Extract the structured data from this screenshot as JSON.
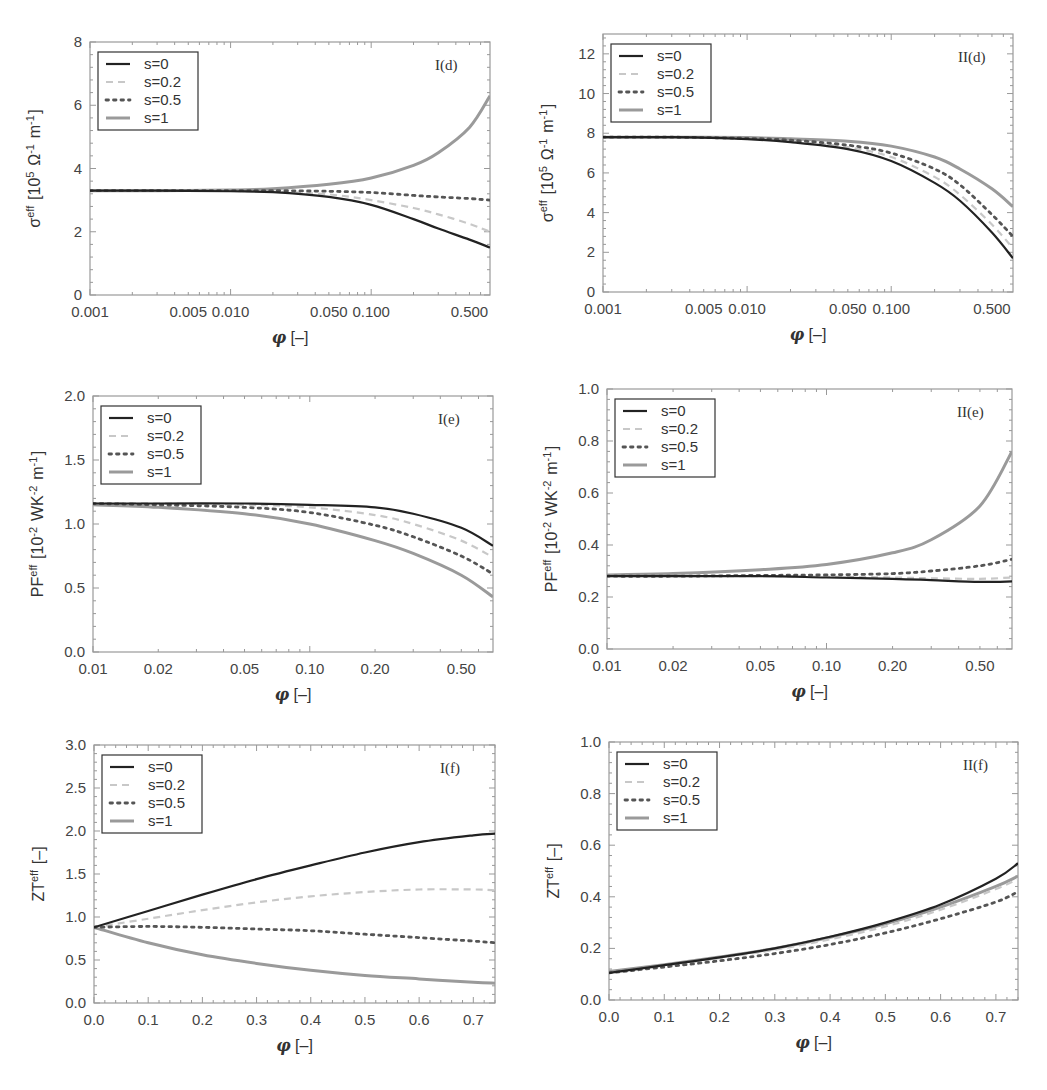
{
  "figure": {
    "legend_entries": [
      "s=0",
      "s=0.2",
      "s=0.5",
      "s=1"
    ],
    "series_styles": [
      {
        "name": "s=0",
        "color": "#222222",
        "dash": "",
        "width": 2.2
      },
      {
        "name": "s=0.2",
        "color": "#c8c8c8",
        "dash": "7,5",
        "width": 2.2
      },
      {
        "name": "s=0.5",
        "color": "#555555",
        "dash": "2.5,5",
        "width": 2.8
      },
      {
        "name": "s=1",
        "color": "#9a9a9a",
        "dash": "",
        "width": 3.0
      }
    ]
  },
  "chart_data": [
    {
      "id": "I(d)",
      "type": "line",
      "tag": "I(d)",
      "xscale": "log",
      "xlim": [
        0.001,
        0.7
      ],
      "ylim": [
        0,
        8
      ],
      "xticks": [
        0.001,
        0.005,
        0.01,
        0.05,
        0.1,
        0.5
      ],
      "xtick_labels": [
        "0.001",
        "0.005",
        "0.010",
        "0.050",
        "0.100",
        "0.500"
      ],
      "yticks": [
        0,
        2,
        4,
        6,
        8
      ],
      "ytick_labels": [
        "0",
        "2",
        "4",
        "6",
        "8"
      ],
      "xlabel": "φ [–]",
      "ylabel": "σ^eff [10^5 Ω^-1 m^-1]",
      "box": [
        90,
        42,
        490,
        295
      ],
      "x": [
        0.001,
        0.003,
        0.01,
        0.02,
        0.05,
        0.1,
        0.2,
        0.3,
        0.5,
        0.7
      ],
      "series": [
        {
          "name": "s=0",
          "values": [
            3.3,
            3.3,
            3.28,
            3.25,
            3.1,
            2.85,
            2.4,
            2.1,
            1.75,
            1.5
          ]
        },
        {
          "name": "s=0.2",
          "values": [
            3.3,
            3.3,
            3.29,
            3.27,
            3.18,
            3.0,
            2.75,
            2.55,
            2.25,
            2.0
          ]
        },
        {
          "name": "s=0.5",
          "values": [
            3.3,
            3.3,
            3.3,
            3.3,
            3.28,
            3.24,
            3.15,
            3.1,
            3.05,
            3.0
          ]
        },
        {
          "name": "s=1",
          "values": [
            3.3,
            3.3,
            3.32,
            3.36,
            3.5,
            3.7,
            4.1,
            4.5,
            5.3,
            6.3
          ]
        }
      ]
    },
    {
      "id": "II(d)",
      "type": "line",
      "tag": "II(d)",
      "xscale": "log",
      "xlim": [
        0.001,
        0.7
      ],
      "ylim": [
        0,
        13
      ],
      "xticks": [
        0.001,
        0.005,
        0.01,
        0.05,
        0.1,
        0.5
      ],
      "xtick_labels": [
        "0.001",
        "0.005",
        "0.010",
        "0.050",
        "0.100",
        "0.500"
      ],
      "yticks": [
        0,
        2,
        4,
        6,
        8,
        10,
        12
      ],
      "ytick_labels": [
        "0",
        "2",
        "4",
        "6",
        "8",
        "10",
        "12"
      ],
      "xlabel": "φ [–]",
      "ylabel": "σ^eff [10^5 Ω^-1 m^-1]",
      "box": [
        603,
        34,
        1013,
        292
      ],
      "x": [
        0.001,
        0.003,
        0.01,
        0.02,
        0.05,
        0.1,
        0.2,
        0.3,
        0.5,
        0.7
      ],
      "series": [
        {
          "name": "s=0",
          "values": [
            7.8,
            7.8,
            7.7,
            7.55,
            7.2,
            6.6,
            5.5,
            4.6,
            3.0,
            1.7
          ]
        },
        {
          "name": "s=0.2",
          "values": [
            7.8,
            7.8,
            7.72,
            7.6,
            7.3,
            6.8,
            5.8,
            4.9,
            3.4,
            2.2
          ]
        },
        {
          "name": "s=0.5",
          "values": [
            7.8,
            7.8,
            7.74,
            7.65,
            7.4,
            7.0,
            6.2,
            5.4,
            3.9,
            2.8
          ]
        },
        {
          "name": "s=1",
          "values": [
            7.8,
            7.8,
            7.78,
            7.72,
            7.6,
            7.35,
            6.8,
            6.2,
            5.2,
            4.3
          ]
        }
      ]
    },
    {
      "id": "I(e)",
      "type": "line",
      "tag": "I(e)",
      "xscale": "log",
      "xlim": [
        0.01,
        0.7
      ],
      "ylim": [
        0,
        2.0
      ],
      "xticks": [
        0.01,
        0.02,
        0.05,
        0.1,
        0.2,
        0.5
      ],
      "xtick_labels": [
        "0.01",
        "0.02",
        "0.05",
        "0.10",
        "0.20",
        "0.50"
      ],
      "yticks": [
        0,
        0.5,
        1.0,
        1.5,
        2.0
      ],
      "ytick_labels": [
        "0.0",
        "0.5",
        "1.0",
        "1.5",
        "2.0"
      ],
      "xlabel": "φ [–]",
      "ylabel": "PF^eff [10^-2 WK^-2 m^-1]",
      "box": [
        93,
        396,
        493,
        652
      ],
      "x": [
        0.01,
        0.02,
        0.05,
        0.1,
        0.2,
        0.3,
        0.5,
        0.7
      ],
      "series": [
        {
          "name": "s=0",
          "values": [
            1.16,
            1.16,
            1.16,
            1.15,
            1.13,
            1.08,
            0.97,
            0.83
          ]
        },
        {
          "name": "s=0.2",
          "values": [
            1.16,
            1.16,
            1.15,
            1.13,
            1.07,
            1.0,
            0.87,
            0.74
          ]
        },
        {
          "name": "s=0.5",
          "values": [
            1.16,
            1.15,
            1.13,
            1.09,
            0.99,
            0.9,
            0.75,
            0.61
          ]
        },
        {
          "name": "s=1",
          "values": [
            1.15,
            1.13,
            1.08,
            1.0,
            0.87,
            0.77,
            0.6,
            0.43
          ]
        }
      ]
    },
    {
      "id": "II(e)",
      "type": "line",
      "tag": "II(e)",
      "xscale": "log",
      "xlim": [
        0.01,
        0.7
      ],
      "ylim": [
        0,
        1.0
      ],
      "xticks": [
        0.01,
        0.02,
        0.05,
        0.1,
        0.2,
        0.5
      ],
      "xtick_labels": [
        "0.01",
        "0.02",
        "0.05",
        "0.10",
        "0.20",
        "0.50"
      ],
      "yticks": [
        0,
        0.2,
        0.4,
        0.6,
        0.8,
        1.0
      ],
      "ytick_labels": [
        "0.0",
        "0.2",
        "0.4",
        "0.6",
        "0.8",
        "1.0"
      ],
      "xlabel": "φ [–]",
      "ylabel": "PF^eff [10^-2 WK^-2 m^-1]",
      "box": [
        607,
        389,
        1012,
        649
      ],
      "x": [
        0.01,
        0.02,
        0.05,
        0.1,
        0.2,
        0.3,
        0.5,
        0.7
      ],
      "series": [
        {
          "name": "s=0",
          "values": [
            0.28,
            0.28,
            0.28,
            0.275,
            0.27,
            0.265,
            0.258,
            0.26
          ]
        },
        {
          "name": "s=0.2",
          "values": [
            0.28,
            0.28,
            0.28,
            0.278,
            0.275,
            0.272,
            0.27,
            0.275
          ]
        },
        {
          "name": "s=0.5",
          "values": [
            0.28,
            0.28,
            0.283,
            0.285,
            0.29,
            0.3,
            0.32,
            0.345
          ]
        },
        {
          "name": "s=1",
          "values": [
            0.285,
            0.29,
            0.305,
            0.325,
            0.37,
            0.42,
            0.55,
            0.76
          ]
        }
      ]
    },
    {
      "id": "I(f)",
      "type": "line",
      "tag": "I(f)",
      "xscale": "linear",
      "xlim": [
        0,
        0.74
      ],
      "ylim": [
        0,
        3.0
      ],
      "xticks": [
        0,
        0.1,
        0.2,
        0.3,
        0.4,
        0.5,
        0.6,
        0.7
      ],
      "xtick_labels": [
        "0.0",
        "0.1",
        "0.2",
        "0.3",
        "0.4",
        "0.5",
        "0.6",
        "0.7"
      ],
      "yticks": [
        0,
        0.5,
        1.0,
        1.5,
        2.0,
        2.5,
        3.0
      ],
      "ytick_labels": [
        "0.0",
        "0.5",
        "1.0",
        "1.5",
        "2.0",
        "2.5",
        "3.0"
      ],
      "xlabel": "φ [–]",
      "ylabel": "ZT^eff [–]",
      "box": [
        94,
        745,
        495,
        1003
      ],
      "x": [
        0,
        0.1,
        0.2,
        0.3,
        0.4,
        0.5,
        0.6,
        0.7,
        0.74
      ],
      "series": [
        {
          "name": "s=0",
          "values": [
            0.88,
            1.07,
            1.26,
            1.44,
            1.6,
            1.75,
            1.87,
            1.95,
            1.97
          ]
        },
        {
          "name": "s=0.2",
          "values": [
            0.88,
            0.98,
            1.08,
            1.17,
            1.24,
            1.29,
            1.32,
            1.32,
            1.31
          ]
        },
        {
          "name": "s=0.5",
          "values": [
            0.88,
            0.89,
            0.88,
            0.86,
            0.84,
            0.8,
            0.76,
            0.72,
            0.7
          ]
        },
        {
          "name": "s=1",
          "values": [
            0.88,
            0.7,
            0.56,
            0.46,
            0.38,
            0.32,
            0.28,
            0.24,
            0.23
          ]
        }
      ]
    },
    {
      "id": "II(f)",
      "type": "line",
      "tag": "II(f)",
      "xscale": "linear",
      "xlim": [
        0,
        0.74
      ],
      "ylim": [
        0,
        1.0
      ],
      "xticks": [
        0,
        0.1,
        0.2,
        0.3,
        0.4,
        0.5,
        0.6,
        0.7
      ],
      "xtick_labels": [
        "0.0",
        "0.1",
        "0.2",
        "0.3",
        "0.4",
        "0.5",
        "0.6",
        "0.7"
      ],
      "yticks": [
        0,
        0.2,
        0.4,
        0.6,
        0.8,
        1.0
      ],
      "ytick_labels": [
        "0.0",
        "0.2",
        "0.4",
        "0.6",
        "0.8",
        "1.0"
      ],
      "xlabel": "φ [–]",
      "ylabel": "ZT^eff [–]",
      "box": [
        609,
        742,
        1018,
        1000
      ],
      "x": [
        0,
        0.1,
        0.2,
        0.3,
        0.4,
        0.5,
        0.6,
        0.7,
        0.74
      ],
      "series": [
        {
          "name": "s=0",
          "values": [
            0.105,
            0.135,
            0.165,
            0.2,
            0.245,
            0.3,
            0.37,
            0.47,
            0.53
          ]
        },
        {
          "name": "s=0.2",
          "values": [
            0.105,
            0.133,
            0.162,
            0.195,
            0.235,
            0.285,
            0.35,
            0.43,
            0.47
          ]
        },
        {
          "name": "s=0.5",
          "values": [
            0.105,
            0.128,
            0.152,
            0.18,
            0.215,
            0.26,
            0.315,
            0.38,
            0.42
          ]
        },
        {
          "name": "s=1",
          "values": [
            0.11,
            0.137,
            0.167,
            0.2,
            0.243,
            0.295,
            0.36,
            0.44,
            0.48
          ]
        }
      ]
    }
  ]
}
